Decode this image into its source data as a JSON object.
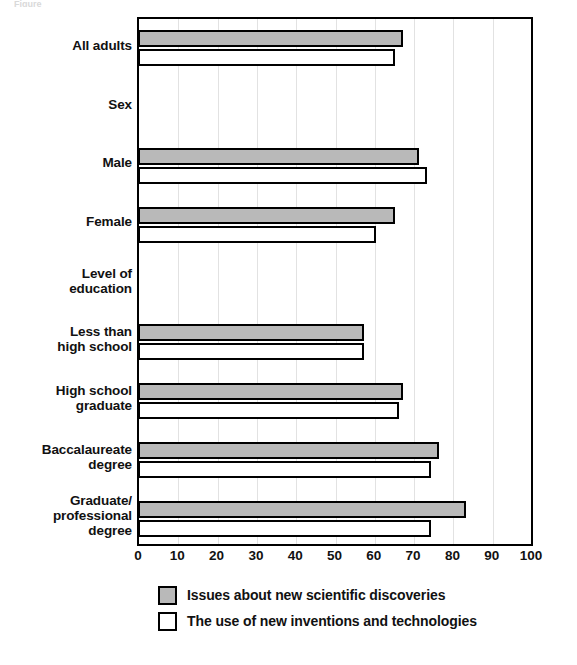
{
  "top_sliver_text": "Figure  ",
  "chart_data": {
    "type": "bar",
    "orientation": "horizontal",
    "title": "",
    "xlabel": "",
    "ylabel": "",
    "xlim": [
      0,
      100
    ],
    "xticks": [
      0,
      10,
      20,
      30,
      40,
      50,
      60,
      70,
      80,
      90,
      100
    ],
    "xtick_labels": [
      "0",
      "10",
      "20",
      "30",
      "40",
      "50",
      "60",
      "70",
      "80",
      "90",
      "100"
    ],
    "grid": "vertical",
    "legend_position": "bottom",
    "categories": [
      "All adults",
      "Sex",
      "Male",
      "Female",
      "Level of\neducation",
      "Less than\nhigh school",
      "High school\ngraduate",
      "Baccalaureate\ndegree",
      "Graduate/\nprofessional\ndegree"
    ],
    "group_headers": [
      "Sex",
      "Level of\neducation"
    ],
    "series": [
      {
        "name": "Issues about new scientific discoveries",
        "color": "#b9b9b9",
        "values": [
          67,
          null,
          71,
          65,
          null,
          57,
          67,
          76,
          83
        ]
      },
      {
        "name": "The use of new inventions and technologies",
        "color": "#ffffff",
        "values": [
          65,
          null,
          73,
          60,
          null,
          57,
          66,
          74,
          74
        ]
      }
    ]
  },
  "categories": [
    {
      "label_lines": [
        "All adults"
      ],
      "is_header": false
    },
    {
      "label_lines": [
        "Sex"
      ],
      "is_header": true
    },
    {
      "label_lines": [
        "Male"
      ],
      "is_header": false
    },
    {
      "label_lines": [
        "Female"
      ],
      "is_header": false
    },
    {
      "label_lines": [
        "Level of",
        "education"
      ],
      "is_header": true
    },
    {
      "label_lines": [
        "Less than",
        "high school"
      ],
      "is_header": false
    },
    {
      "label_lines": [
        "High school",
        "graduate"
      ],
      "is_header": false
    },
    {
      "label_lines": [
        "Baccalaureate",
        "degree"
      ],
      "is_header": false
    },
    {
      "label_lines": [
        "Graduate/",
        "professional",
        "degree"
      ],
      "is_header": false
    }
  ],
  "legend": {
    "items": [
      {
        "label": "Issues about new scientific discoveries",
        "swatch": "series-a"
      },
      {
        "label": "The use of new inventions and technologies",
        "swatch": "series-b"
      }
    ]
  },
  "colors": {
    "series_a_fill": "#b9b9b9",
    "series_b_fill": "#ffffff",
    "outline": "#000000",
    "gridline": "#e2e2e2",
    "text": "#111111"
  }
}
